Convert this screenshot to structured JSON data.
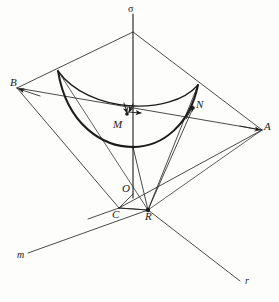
{
  "figure": {
    "stroke_color": "#1c1c1c",
    "background_color": "#fdfdfc"
  },
  "labels": {
    "sigma": {
      "text": "σ",
      "x": 128,
      "y": 4
    },
    "B": {
      "text": "B",
      "x": 10,
      "y": 77
    },
    "A": {
      "text": "A",
      "x": 264,
      "y": 121
    },
    "N": {
      "text": "N",
      "x": 196,
      "y": 99
    },
    "M": {
      "text": "M",
      "x": 113,
      "y": 119
    },
    "O": {
      "text": "O",
      "x": 122,
      "y": 183
    },
    "C": {
      "text": "C",
      "x": 112,
      "y": 209
    },
    "R": {
      "text": "R",
      "x": 145,
      "y": 211
    },
    "m": {
      "text": "m",
      "x": 17,
      "y": 250
    },
    "r": {
      "text": "r",
      "x": 245,
      "y": 276
    }
  },
  "points": {
    "apex": {
      "name": "sigma-apex",
      "x": 133,
      "y": 32
    },
    "B": {
      "name": "vertex-B",
      "x": 17,
      "y": 88
    },
    "A": {
      "name": "vertex-A",
      "x": 262,
      "y": 130
    },
    "C": {
      "name": "vertex-C",
      "x": 119,
      "y": 208
    },
    "R": {
      "name": "point-R",
      "x": 148,
      "y": 210
    },
    "O": {
      "name": "point-O",
      "x": 133,
      "y": 197
    },
    "M": {
      "name": "point-M",
      "x": 127,
      "y": 114
    },
    "N": {
      "name": "point-N",
      "x": 193,
      "y": 108
    },
    "V": {
      "name": "curve-vertex",
      "x": 133,
      "y": 147
    },
    "curve_left": {
      "name": "curve-left-end",
      "x": 58,
      "y": 71
    },
    "curve_right": {
      "name": "curve-right-end",
      "x": 198,
      "y": 85
    },
    "sigma_top": {
      "name": "sigma-axis-top",
      "x": 133,
      "y": 14
    },
    "m_end": {
      "name": "line-m-end",
      "x": 28,
      "y": 253
    },
    "r_end": {
      "name": "line-r-end",
      "x": 240,
      "y": 281
    }
  },
  "elements": {
    "quadrilateral": "apex-B-C-A outline",
    "diagonal_BA": "segment from B to A passing below the curves",
    "vertical_axis": "sigma axis from top through apex, M, V, O to R region",
    "upper_curve": "thin arc from curve-left-end to curve-right-end",
    "lower_curve": "thick parabolic arc from curve-left-end through V to curve-right-end",
    "rays_from_R": [
      "R to curve-left-end",
      "R to V",
      "R to N",
      "R to curve-right-end",
      "R to A",
      "R to C"
    ],
    "ground_lines": [
      "line m from R toward lower-left",
      "line r from R toward lower-right"
    ],
    "arrows": [
      "arrow at M pointing down-left",
      "arrow at M pointing right",
      "arrow at N pointing up-right"
    ]
  }
}
